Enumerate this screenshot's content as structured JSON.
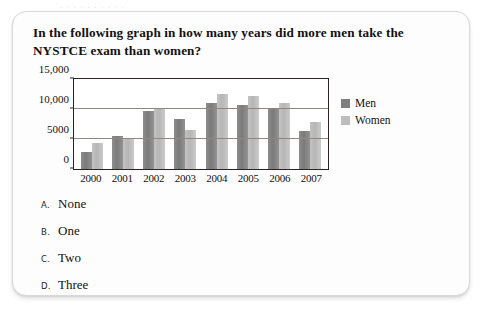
{
  "page_bleed_text": ". . .   .    .       .    .  . . .",
  "question": {
    "text": "In the following graph in how many years did more men take the NYSTCE exam than women?"
  },
  "options": [
    {
      "letter": "A.",
      "text": "None"
    },
    {
      "letter": "B.",
      "text": "One"
    },
    {
      "letter": "C.",
      "text": "Two"
    },
    {
      "letter": "D.",
      "text": "Three"
    }
  ],
  "colors": {
    "men": "#7f7f7f",
    "women": "#bdbdbd",
    "axis": "#2a2522",
    "gridline": "#8d8882",
    "text": "#14110f",
    "card_border": "#d8d8d8"
  },
  "chart_data": {
    "type": "bar",
    "title": "",
    "xlabel": "",
    "ylabel": "",
    "categories": [
      "2000",
      "2001",
      "2002",
      "2003",
      "2004",
      "2005",
      "2006",
      "2007"
    ],
    "series": [
      {
        "name": "Men",
        "color": "#7f7f7f",
        "values": [
          2900,
          5500,
          9700,
          8400,
          11000,
          10700,
          10200,
          6400
        ]
      },
      {
        "name": "Women",
        "color": "#bdbdbd",
        "values": [
          4400,
          5200,
          10200,
          6500,
          12500,
          12200,
          11000,
          7900
        ]
      }
    ],
    "ylim": [
      0,
      15000
    ],
    "yticks": [
      0,
      5000,
      10000,
      15000
    ],
    "ytick_labels": [
      "0",
      "5000",
      "10,000",
      "15,000"
    ],
    "grid": true,
    "legend_position": "right",
    "legend_entries": [
      "Men",
      "Women"
    ]
  }
}
